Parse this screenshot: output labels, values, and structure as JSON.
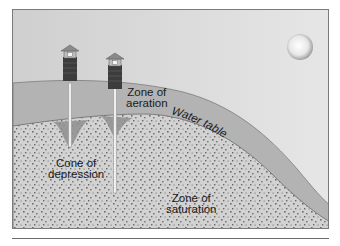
{
  "figure": {
    "labels": {
      "zone_aeration": "Zone of\naeration",
      "cone_depression": "Cone of\ndepression",
      "water_table": "Water table",
      "zone_saturation": "Zone of\nsaturation"
    },
    "colors": {
      "sky": "#dedede",
      "ground_aeration": "#b4b4b4",
      "saturation_fill": "#cfcfcf",
      "dots": "#6e6e6e",
      "border": "#7a7a7a",
      "cone": "#8f8f8f",
      "well_brick": "#3a3a3a",
      "sun": "#f2f2f2"
    },
    "elements": {
      "wells_count": 2,
      "sun": "sun-icon"
    }
  }
}
